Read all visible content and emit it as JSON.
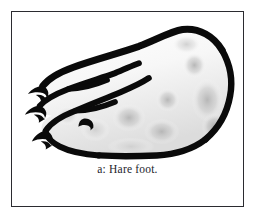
{
  "figure": {
    "caption": "a: Hare foot.",
    "label": "a",
    "subject": "Hare foot",
    "alt_description": "Black ink outline drawing of a hare's hind foot shown in side view, pointing left, with three clawed toes and soft grey shaded pads",
    "style": "ink line drawing with soft airbrushed grey shading",
    "colors": {
      "ink": "#0a0a0a",
      "frame": "#2b2b30",
      "background": "#ffffff",
      "shading_light": "#e4e4e4",
      "shading_mid": "#c9c9c9",
      "shading_dark": "#b0b0b0",
      "caption_text": "#23232a"
    },
    "frame": {
      "visible": true,
      "shape": "rectangle",
      "border_width_px": 1.4
    },
    "anatomy_parts": [
      {
        "name": "upper-toe",
        "description": "longest upper toe with claw"
      },
      {
        "name": "middle-toe",
        "description": "middle toe with claw"
      },
      {
        "name": "lower-toe",
        "description": "lower toe with claw"
      },
      {
        "name": "foot-pad-sole",
        "description": "underside sole of the foot"
      },
      {
        "name": "heel",
        "description": "rounded heel at the right"
      }
    ],
    "shading_blobs": [
      {
        "cx": 176,
        "cy": 32,
        "rx": 13,
        "ry": 9,
        "tone": "light"
      },
      {
        "cx": 183,
        "cy": 52,
        "rx": 11,
        "ry": 12,
        "tone": "mid"
      },
      {
        "cx": 196,
        "cy": 88,
        "rx": 15,
        "ry": 21,
        "tone": "mid"
      },
      {
        "cx": 156,
        "cy": 88,
        "rx": 11,
        "ry": 11,
        "tone": "mid"
      },
      {
        "cx": 117,
        "cy": 106,
        "rx": 16,
        "ry": 13,
        "tone": "mid"
      },
      {
        "cx": 150,
        "cy": 120,
        "rx": 17,
        "ry": 13,
        "tone": "mid"
      },
      {
        "cx": 83,
        "cy": 118,
        "rx": 14,
        "ry": 11,
        "tone": "light"
      },
      {
        "cx": 55,
        "cy": 104,
        "rx": 11,
        "ry": 9,
        "tone": "light"
      }
    ]
  }
}
